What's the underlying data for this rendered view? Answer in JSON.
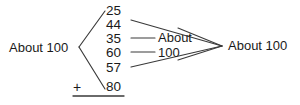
{
  "diagram": {
    "type": "arithmetic-estimation-grouping",
    "left_group_label": "About 100",
    "middle_group_label_line1": "About",
    "middle_group_label_line2": "100",
    "right_total_label": "About 100",
    "plus_sign": "+",
    "addends": [
      {
        "value": "25",
        "group": "left"
      },
      {
        "value": "44",
        "group": "middle"
      },
      {
        "value": "35",
        "group": "middle"
      },
      {
        "value": "60",
        "group": "middle"
      },
      {
        "value": "57",
        "group": "middle"
      },
      {
        "value": "80",
        "group": "left"
      }
    ],
    "colors": {
      "ink": "#1a1a1a",
      "line": "#3a3a3a",
      "background": "#ffffff"
    }
  }
}
